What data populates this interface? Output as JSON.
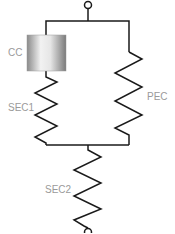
{
  "diagram": {
    "labels": {
      "cc": "CC",
      "sec1": "SEC1",
      "pec": "PEC",
      "sec2": "SEC2"
    },
    "colors": {
      "line": "#1a1a1a",
      "label": "#9a9a9a"
    }
  }
}
